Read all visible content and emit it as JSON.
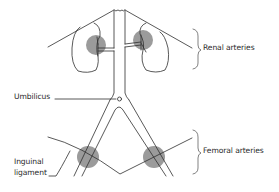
{
  "diagram": {
    "type": "anatomical-diagram",
    "colors": {
      "line": "#2e2e2e",
      "marker_fill": "#8a8a8a",
      "background": "#ffffff"
    },
    "labels": {
      "renal_arteries": "Renal arteries",
      "umbilicus": "Umbilicus",
      "inguinal_ligament_line1": "Inguinal",
      "inguinal_ligament_line2": "ligament",
      "femoral_arteries": "Femoral arteries"
    },
    "markers": [
      {
        "name": "left-renal-artery-site",
        "cx": 96,
        "cy": 45,
        "r": 10
      },
      {
        "name": "right-renal-artery-site",
        "cx": 143,
        "cy": 40,
        "r": 10
      },
      {
        "name": "left-femoral-artery-site",
        "cx": 88,
        "cy": 157,
        "r": 11
      },
      {
        "name": "right-femoral-artery-site",
        "cx": 154,
        "cy": 157,
        "r": 11
      }
    ]
  }
}
